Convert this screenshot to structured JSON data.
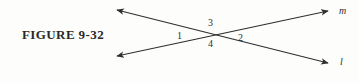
{
  "figure": {
    "caption": "FIGURE 9-32",
    "background_color": "#fdfdfc",
    "ink_color": "#2e2e2e"
  },
  "diagram": {
    "type": "two-intersecting-lines",
    "intersection": {
      "x": 212,
      "y": 36
    },
    "lines": [
      {
        "name": "line-m",
        "label": "m",
        "from": {
          "x": 117,
          "y": 56
        },
        "to": {
          "x": 328,
          "y": 11
        },
        "arrowheads": [
          "start",
          "end"
        ]
      },
      {
        "name": "line-l",
        "label": "l",
        "from": {
          "x": 117,
          "y": 10
        },
        "to": {
          "x": 328,
          "y": 63
        },
        "arrowheads": [
          "start",
          "end"
        ]
      }
    ],
    "angle_labels": [
      {
        "name": "angle-1",
        "text": "1",
        "position": "left"
      },
      {
        "name": "angle-2",
        "text": "2",
        "position": "right"
      },
      {
        "name": "angle-3",
        "text": "3",
        "position": "top"
      },
      {
        "name": "angle-4",
        "text": "4",
        "position": "bottom"
      }
    ],
    "line_labels": [
      {
        "name": "label-m",
        "text": "m",
        "position": "upper-right"
      },
      {
        "name": "label-l",
        "text": "l",
        "position": "lower-right"
      }
    ]
  }
}
